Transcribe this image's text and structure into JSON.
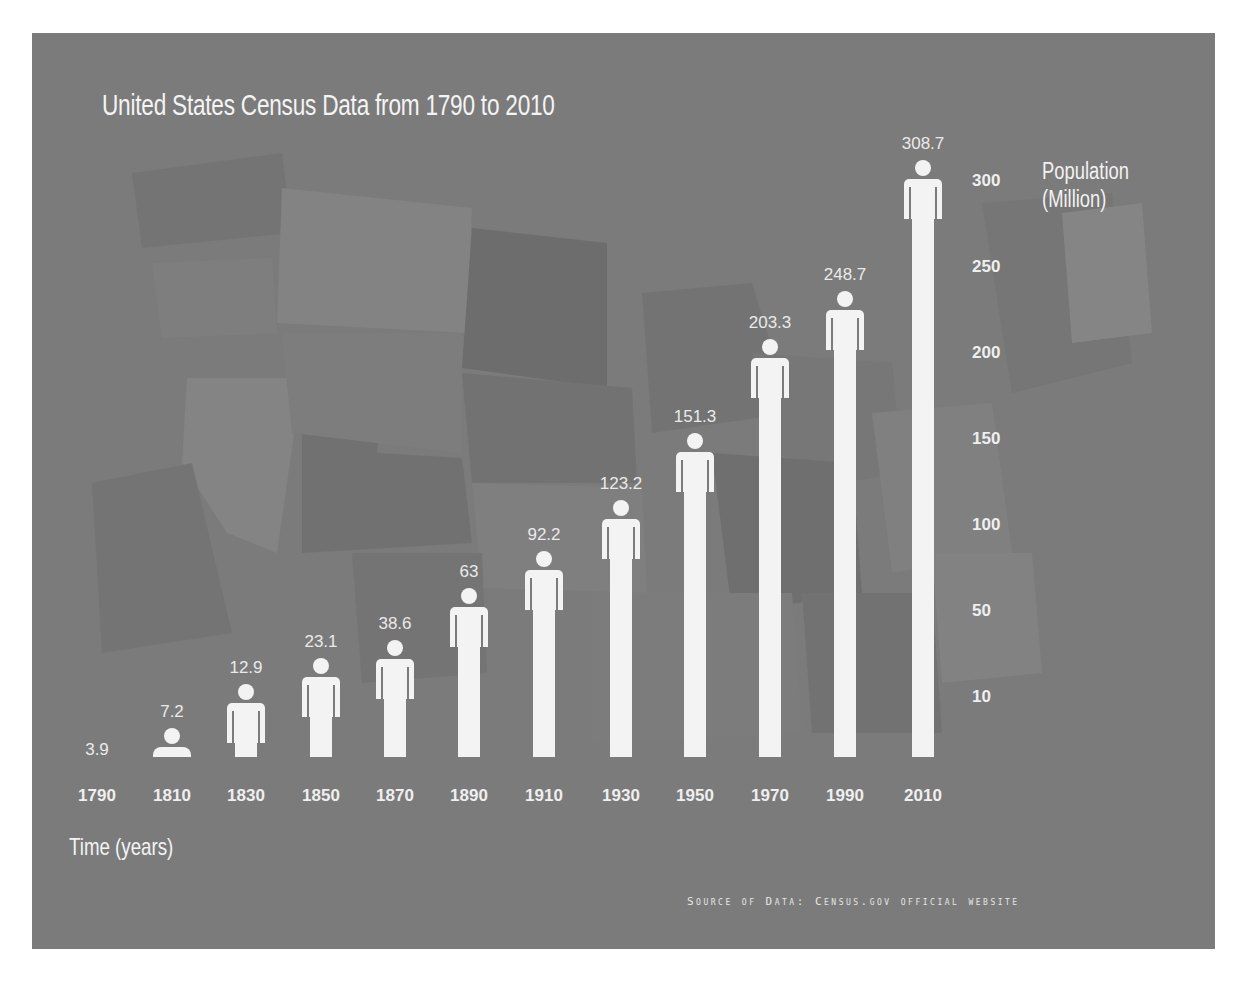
{
  "title": "United States Census Data from 1790 to 2010",
  "y_axis_label_line1": "Population",
  "y_axis_label_line2": "(Million)",
  "x_axis_label": "Time (years)",
  "source": "Source of Data: Census.gov official website",
  "colors": {
    "background": "#7b7b7b",
    "figure": "#f3f3f3",
    "text": "#f0f0f0",
    "page": "#ffffff"
  },
  "y_ticks": [
    "300",
    "250",
    "200",
    "150",
    "100",
    "50",
    "10"
  ],
  "x_ticks": [
    "1790",
    "1810",
    "1830",
    "1850",
    "1870",
    "1890",
    "1910",
    "1930",
    "1950",
    "1970",
    "1990",
    "2010"
  ],
  "value_labels": [
    "3.9",
    "7.2",
    "12.9",
    "23.1",
    "38.6",
    "63",
    "92.2",
    "123.2",
    "151.3",
    "203.3",
    "248.7",
    "308.7"
  ],
  "chart_data": {
    "type": "bar",
    "title": "United States Census Data from 1790 to 2010",
    "xlabel": "Time (years)",
    "ylabel": "Population (Million)",
    "categories": [
      "1790",
      "1810",
      "1830",
      "1850",
      "1870",
      "1890",
      "1910",
      "1930",
      "1950",
      "1970",
      "1990",
      "2010"
    ],
    "values": [
      3.9,
      7.2,
      12.9,
      23.1,
      38.6,
      63,
      92.2,
      123.2,
      151.3,
      203.3,
      248.7,
      308.7
    ],
    "y_ticks": [
      10,
      50,
      100,
      150,
      200,
      250,
      300
    ],
    "ylim": [
      0,
      320
    ],
    "grid": false,
    "legend": "none",
    "bar_style": "pictograph human figures",
    "y_axis_position": "right",
    "source": "Census.gov official website"
  }
}
